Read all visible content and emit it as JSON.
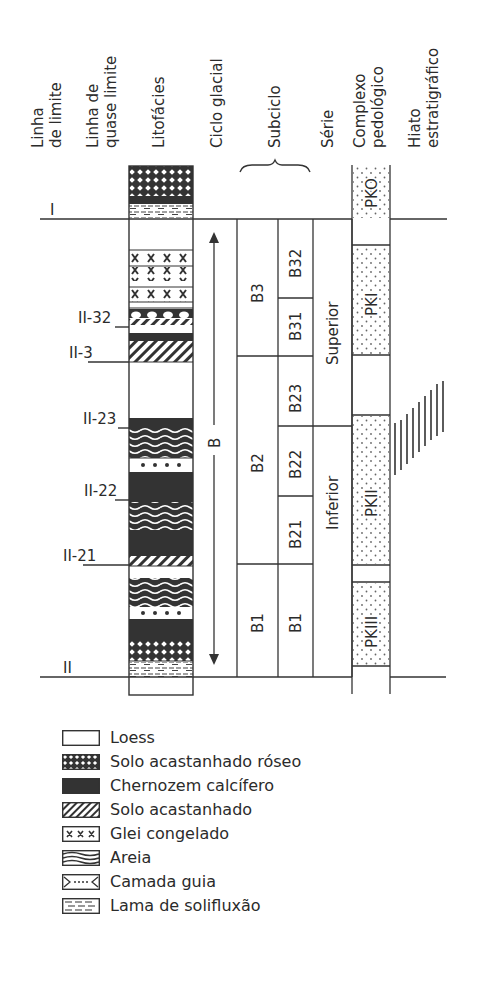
{
  "headers": {
    "linha_limite": [
      "Linha",
      "de limite"
    ],
    "linha_quase_limite": [
      "Linha de",
      "quase limite"
    ],
    "litofacies": "Litofácies",
    "ciclo_glacial": "Ciclo glacial",
    "subciclo": "Subciclo",
    "serie": "Série",
    "complexo_pedologico": [
      "Complexo",
      "pedológico"
    ],
    "hiato": [
      "Hiato",
      "estratigráfico"
    ]
  },
  "boundaries": [
    {
      "label": "I",
      "type": "limite"
    },
    {
      "label": "II-32",
      "type": "quase-limite"
    },
    {
      "label": "II-3",
      "type": "quase-limite"
    },
    {
      "label": "II-23",
      "type": "quase-limite"
    },
    {
      "label": "II-22",
      "type": "quase-limite"
    },
    {
      "label": "II-21",
      "type": "quase-limite"
    },
    {
      "label": "II",
      "type": "limite"
    }
  ],
  "ciclo_glacial": {
    "label": "B"
  },
  "subciclos": {
    "main": [
      "B3",
      "B2",
      "B1"
    ],
    "sub": [
      "B32",
      "B31",
      "B23",
      "B22",
      "B21",
      "B1"
    ]
  },
  "series": [
    "Superior",
    "Inferior"
  ],
  "complexos": [
    "PKO",
    "PKI",
    "PKII",
    "PKIII"
  ],
  "litofacies_top_to_bottom": [
    "Solo acastanhado róseo",
    "Chernozem calcífero",
    "Lama de solifluxão",
    "Loess",
    "Glei congelado",
    "Glei congelado",
    "Loess",
    "Glei congelado",
    "Camada guia",
    "Solo acastanhado",
    "Loess",
    "Chernozem calcífero",
    "Solo acastanhado",
    "Loess",
    "Chernozem calcífero",
    "Areia",
    "Camada guia",
    "Chernozem calcífero",
    "Areia",
    "Chernozem calcífero",
    "Solo acastanhado",
    "Loess",
    "Areia",
    "Camada guia",
    "Chernozem calcífero",
    "Solo acastanhado róseo",
    "Lama de solifluxão",
    "Lama de solifluxão"
  ],
  "legend": {
    "items": [
      {
        "key": "loess",
        "label": "Loess"
      },
      {
        "key": "pink-brown-soil",
        "label": "Solo acastanhado róseo"
      },
      {
        "key": "chernozem",
        "label": "Chernozem calcífero"
      },
      {
        "key": "brown-soil",
        "label": "Solo acastanhado"
      },
      {
        "key": "gley",
        "label": "Glei congelado"
      },
      {
        "key": "sand",
        "label": "Areia"
      },
      {
        "key": "marker-bed",
        "label": "Camada guia"
      },
      {
        "key": "solifluction",
        "label": "Lama de solifluxão"
      }
    ]
  },
  "colors": {
    "ink": "#2b2b2b",
    "paper": "#ffffff",
    "dark_fill": "#333333"
  }
}
